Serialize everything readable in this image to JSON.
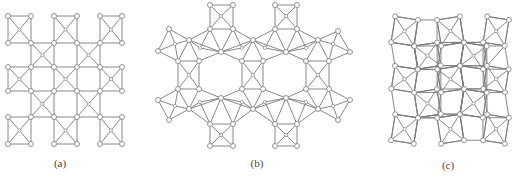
{
  "figure": {
    "panels": [
      {
        "id": "a",
        "label": "(a)",
        "label_pos": [
          60,
          165
        ],
        "type": "square-lattice",
        "description": "Square lattice of corner-sharing squares, each decorated with diagonal center node",
        "origin": [
          8,
          16
        ],
        "spacing": 22.6,
        "grid": 6,
        "rotation_deg": 0
      },
      {
        "id": "b",
        "label": "(b)",
        "label_pos": [
          257,
          165
        ],
        "type": "hexagonal-ring",
        "description": "Hexagonal framework of triangulated units with square pendants, enclosing two large hexagonal pores"
      },
      {
        "id": "c",
        "label": "(c)",
        "label_pos": [
          448,
          167
        ],
        "type": "square-lattice",
        "description": "Distorted square lattice: alternating rotated squares, each with diagonal center node",
        "origin": [
          393,
          18
        ],
        "spacing": 22.6,
        "grid": 6,
        "rotation_deg": 9
      }
    ],
    "colors": {
      "edge": "#7a7a7a",
      "node_fill": "#ffffff",
      "background": "#ffffff"
    }
  }
}
